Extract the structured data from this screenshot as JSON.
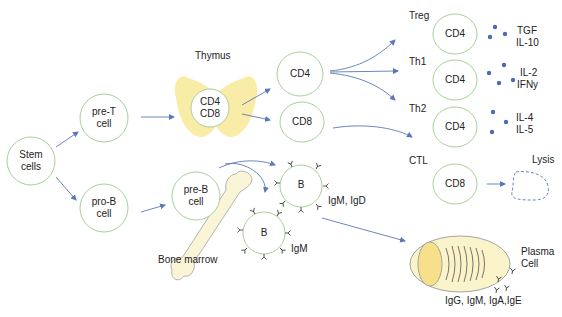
{
  "colors": {
    "cell_border": "#a8cf9a",
    "arrow": "#5b78b8",
    "cytokine_dot": "#4a6bb5",
    "thymus_fill": "#f7ea9c",
    "bone_fill": "#faf5d6",
    "plasma_fill": "#fbf3c9",
    "plasma_nucleus": "#f7e08a"
  },
  "nodes": {
    "stem": {
      "line1": "Stem",
      "line2": "cells"
    },
    "pre_t": {
      "line1": "pre-T",
      "line2": "cell"
    },
    "pro_b": {
      "line1": "pro-B",
      "line2": "cell"
    },
    "thymus_cell": {
      "line1": "CD4",
      "line2": "CD8"
    },
    "cd4": "CD4",
    "cd8": "CD8",
    "pre_b": {
      "line1": "pre-B",
      "line2": "cell"
    },
    "b_upper": "B",
    "b_lower": "B",
    "treg_cell": "CD4",
    "th1_cell": "CD4",
    "th2_cell": "CD4",
    "ctl_cell": "CD8"
  },
  "labels": {
    "thymus": "Thymus",
    "bone_marrow": "Bone marrow",
    "treg": "Treg",
    "th1": "Th1",
    "th2": "Th2",
    "ctl": "CTL",
    "lysis": "Lysis",
    "plasma_line1": "Plasma",
    "plasma_line2": "Cell",
    "b_upper_ig": "IgM, IgD",
    "b_lower_ig": "IgM",
    "plasma_ig": "IgG, IgM, IgA,IgE"
  },
  "cytokines": {
    "treg": {
      "line1": "TGF",
      "line2": "IL-10"
    },
    "th1": {
      "line1": "IL-2",
      "line2": "IFNy"
    },
    "th2": {
      "line1": "IL-4",
      "line2": "IL-5"
    }
  }
}
